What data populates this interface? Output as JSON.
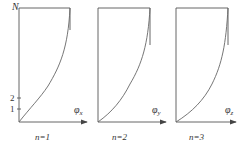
{
  "y_axis": {
    "label": "N",
    "ticks": [
      "1",
      "2"
    ]
  },
  "panels": [
    {
      "axis_label": "φ",
      "subscript": "x",
      "caption": "n=1"
    },
    {
      "axis_label": "φ",
      "subscript": "y",
      "caption": "n=2"
    },
    {
      "axis_label": "φ",
      "subscript": "z",
      "caption": "n=3"
    }
  ],
  "colors": {
    "line": "#555555"
  }
}
